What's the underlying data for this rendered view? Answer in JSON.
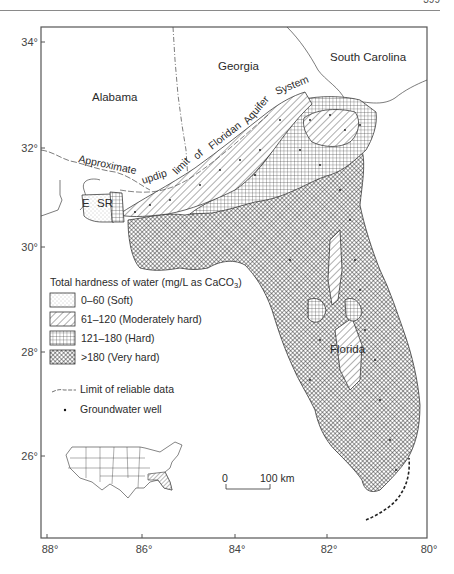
{
  "page": {
    "page_number": "399"
  },
  "map": {
    "title": "Total hardness of water in the Floridan Aquifer System",
    "frame": {
      "left": 41,
      "top": 27,
      "right": 427,
      "bottom": 538
    },
    "lat_ticks": [
      {
        "label": "34°",
        "y": 42
      },
      {
        "label": "32°",
        "y": 148
      },
      {
        "label": "30°",
        "y": 247
      },
      {
        "label": "28°",
        "y": 352
      },
      {
        "label": "26°",
        "y": 456
      }
    ],
    "lon_ticks": [
      {
        "label": "88°",
        "x": 47
      },
      {
        "label": "86°",
        "x": 142
      },
      {
        "label": "84°",
        "x": 235
      },
      {
        "label": "82°",
        "x": 327
      },
      {
        "label": "80°",
        "x": 427
      }
    ],
    "state_labels": {
      "alabama": "Alabama",
      "georgia": "Georgia",
      "south_carolina": "South Carolina",
      "florida": "Florida"
    },
    "abbrev_labels": {
      "e": "E",
      "sr": "SR"
    },
    "updip_line_label": [
      "Approximate",
      "updip",
      "limit",
      "of",
      "Floridan",
      "Aquifer",
      "System"
    ],
    "legend": {
      "title": "Total hardness of water (mg/L as CaCO",
      "title_sub": "3",
      "title_end": ")",
      "items": [
        {
          "pattern": "soft",
          "label": "0–60 (Soft)"
        },
        {
          "pattern": "moderate",
          "label": "61–120 (Moderately hard)"
        },
        {
          "pattern": "hard",
          "label": "121–180 (Hard)"
        },
        {
          "pattern": "veryhard",
          "label": ">180 (Very hard)"
        }
      ],
      "line_item": "Limit of reliable data",
      "point_item": "Groundwater well"
    },
    "scale_bar": {
      "zero": "0",
      "distance": "100 km"
    },
    "colors": {
      "ink": "#2a2a2a",
      "frame": "#555555",
      "background": "#ffffff"
    }
  }
}
